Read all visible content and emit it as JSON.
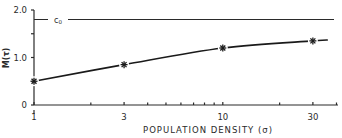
{
  "chart_data": {
    "type": "line",
    "title": "",
    "xlabel": "POPULATION DENSITY (σ)",
    "ylabel": "M(τ)",
    "xscale": "log",
    "xlim": [
      1,
      40
    ],
    "ylim": [
      0,
      2.0
    ],
    "x_ticks": [
      "1",
      "3",
      "10",
      "30"
    ],
    "y_ticks": [
      "0",
      "1.0",
      "2.0"
    ],
    "series": [
      {
        "name": "M(τ)",
        "marker": "asterisk",
        "x": [
          1,
          3,
          10,
          30
        ],
        "values": [
          0.5,
          0.85,
          1.2,
          1.35
        ]
      }
    ],
    "reference_lines": [
      {
        "label": "c0",
        "value": 1.8
      }
    ],
    "grid": false,
    "legend": "none"
  },
  "labels": {
    "x_axis": "POPULATION DENSITY (σ)",
    "y_axis": "M(τ)",
    "ref_line": "c",
    "ref_line_sub": "0"
  }
}
